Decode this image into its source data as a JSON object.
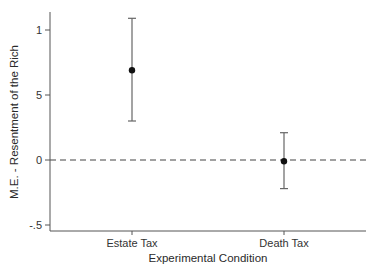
{
  "chart_data": {
    "type": "scatter",
    "subtype": "point-estimate-with-error-bars",
    "title": "",
    "xlabel": "Experimental Condition",
    "ylabel": "M.E. - Resentment of the Rich",
    "categories": [
      "Estate Tax",
      "Death Tax"
    ],
    "series": [
      {
        "name": "Marginal effect",
        "values": [
          0.69,
          -0.01
        ],
        "ci_lower": [
          0.3,
          -0.22
        ],
        "ci_upper": [
          1.09,
          0.21
        ]
      }
    ],
    "yticks": [
      1,
      0.5,
      0,
      -0.5
    ],
    "ytick_labels": [
      "1",
      "5",
      "0",
      "-.5"
    ],
    "ylim": [
      -0.55,
      1.14
    ],
    "reference_line": {
      "y": 0,
      "style": "dashed"
    },
    "grid": false,
    "legend": null
  },
  "colors": {
    "axis": "#555555",
    "point": "#111111",
    "errorbar": "#666666",
    "refline": "#444444"
  }
}
